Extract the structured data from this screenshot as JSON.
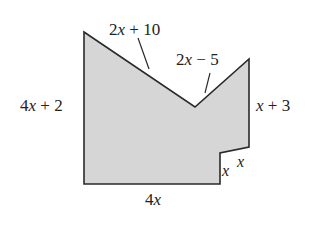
{
  "figure": {
    "fill_color": "#d6d6d6",
    "stroke_color": "#2a2a2a",
    "vertices": [
      [
        84,
        32
      ],
      [
        195,
        107
      ],
      [
        249,
        59
      ],
      [
        249,
        147
      ],
      [
        220,
        153
      ],
      [
        220,
        184
      ],
      [
        84,
        184
      ]
    ],
    "labels": {
      "top_left_slant": {
        "coef": "2",
        "var": "x",
        "rest": " + 10"
      },
      "top_right_slant": {
        "coef": "2",
        "var": "x",
        "rest": " − 5"
      },
      "left_side": {
        "coef": "4",
        "var": "x",
        "rest": " + 2"
      },
      "right_side": {
        "coef": "",
        "var": "x",
        "rest": " + 3"
      },
      "notch_horizontal": {
        "coef": "",
        "var": "x",
        "rest": ""
      },
      "notch_vertical": {
        "coef": "",
        "var": "x",
        "rest": ""
      },
      "bottom_side": {
        "coef": "4",
        "var": "x",
        "rest": ""
      }
    }
  }
}
